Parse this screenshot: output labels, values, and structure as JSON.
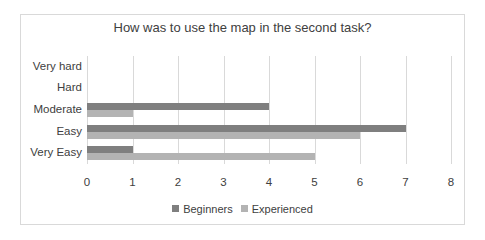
{
  "chart_data": {
    "type": "bar",
    "orientation": "horizontal",
    "title": "How was to use the map in the second task?",
    "categories": [
      "Very Easy",
      "Easy",
      "Moderate",
      "Hard",
      "Very hard"
    ],
    "series": [
      {
        "name": "Beginners",
        "color": "#7f7f7f",
        "values": [
          1,
          7,
          4,
          0,
          0
        ]
      },
      {
        "name": "Experienced",
        "color": "#b3b3b3",
        "values": [
          5,
          6,
          1,
          0,
          0
        ]
      }
    ],
    "xlabel": "",
    "ylabel": "",
    "xlim": [
      0,
      8
    ],
    "xticks": [
      "0",
      "1",
      "2",
      "3",
      "4",
      "5",
      "6",
      "7",
      "8"
    ],
    "grid": true,
    "legend_position": "bottom"
  }
}
